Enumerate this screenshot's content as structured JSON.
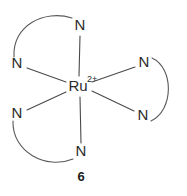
{
  "figure": {
    "compound_number": "6",
    "background_color": "#ffffff",
    "line_color": "#4a4a4a",
    "text_color": "#2b2b2b"
  },
  "metal_center": {
    "element": "Ru",
    "charge": "2+",
    "x": 78,
    "y": 86
  },
  "donor_atoms": [
    {
      "id": "n-top",
      "element": "N",
      "x": 80,
      "y": 26
    },
    {
      "id": "n-upper-left",
      "element": "N",
      "x": 17,
      "y": 64
    },
    {
      "id": "n-lower-left",
      "element": "N",
      "x": 17,
      "y": 114
    },
    {
      "id": "n-bottom",
      "element": "N",
      "x": 81,
      "y": 152
    },
    {
      "id": "n-upper-right",
      "element": "N",
      "x": 144,
      "y": 63
    },
    {
      "id": "n-lower-right",
      "element": "N",
      "x": 143,
      "y": 116
    }
  ],
  "bonds": [
    {
      "id": "bond-ru-n-top",
      "from": "metal",
      "to": "n-top"
    },
    {
      "id": "bond-ru-n-upper-left",
      "from": "metal",
      "to": "n-upper-left"
    },
    {
      "id": "bond-ru-n-lower-left",
      "from": "metal",
      "to": "n-lower-left"
    },
    {
      "id": "bond-ru-n-bottom",
      "from": "metal",
      "to": "n-bottom"
    },
    {
      "id": "bond-ru-n-upper-right",
      "from": "metal",
      "to": "n-upper-right"
    },
    {
      "id": "bond-ru-n-lower-right",
      "from": "metal",
      "to": "n-lower-right"
    }
  ],
  "chelate_arcs": [
    {
      "id": "arc-top-left",
      "connects": [
        "n-upper-left",
        "n-top"
      ],
      "bulge": "upper-left"
    },
    {
      "id": "arc-bottom-left",
      "connects": [
        "n-lower-left",
        "n-bottom"
      ],
      "bulge": "lower-left"
    },
    {
      "id": "arc-right",
      "connects": [
        "n-upper-right",
        "n-lower-right"
      ],
      "bulge": "right"
    }
  ],
  "caption": {
    "text": "6",
    "x": 81,
    "y": 178
  }
}
